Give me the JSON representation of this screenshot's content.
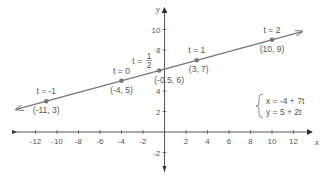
{
  "chart_data": {
    "type": "line",
    "title": "",
    "xlabel": "x",
    "ylabel": "y",
    "xlim": [
      -14,
      13.5
    ],
    "ylim": [
      -3,
      12
    ],
    "grid": false,
    "x_ticks": [
      -12,
      -10,
      -8,
      -6,
      -4,
      -2,
      2,
      4,
      6,
      8,
      10,
      12
    ],
    "y_ticks": [
      -2,
      2,
      4,
      8,
      10
    ],
    "equations": {
      "x": "x = -4 + 7t",
      "y": "y = 5 + 2t"
    },
    "series": [
      {
        "name": "parametric line",
        "points": [
          {
            "t": "-1",
            "x": -11,
            "y": 3,
            "label": "(-11, 3)",
            "t_label": "t = -1"
          },
          {
            "t": "0",
            "x": -4,
            "y": 5,
            "label": "(-4, 5)",
            "t_label": "t = 0"
          },
          {
            "t": "1/2",
            "x": -0.5,
            "y": 6,
            "label": "(-0.5, 6)",
            "t_label": "t = 1/2"
          },
          {
            "t": "1",
            "x": 3,
            "y": 7,
            "label": "(3, 7)",
            "t_label": "t = 1"
          },
          {
            "t": "2",
            "x": 10,
            "y": 9,
            "label": "(10, 9)",
            "t_label": "t = 2"
          }
        ]
      }
    ]
  },
  "colors": {
    "line": "#777777",
    "axis": "#444444",
    "point": "#777777",
    "text": "#555555"
  }
}
